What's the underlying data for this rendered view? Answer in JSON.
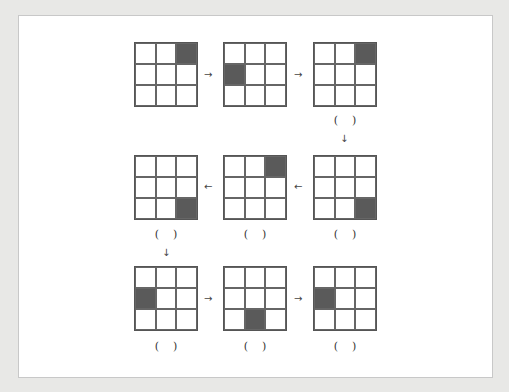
{
  "title": "",
  "colors": {
    "filled": "#5a5a5a",
    "empty": "#ffffff",
    "line": "#555555",
    "background": "#e8e8e6"
  },
  "grids": [
    {
      "id": 1,
      "filled": [
        0,
        2
      ],
      "label": ""
    },
    {
      "id": 2,
      "filled": [
        1,
        0
      ],
      "label": ""
    },
    {
      "id": 3,
      "filled": [
        0,
        2
      ],
      "label": "(    )"
    },
    {
      "id": 4,
      "filled": [
        2,
        2
      ],
      "label": "(    )"
    },
    {
      "id": 5,
      "filled": [
        0,
        2
      ],
      "label": "(    )"
    },
    {
      "id": 6,
      "filled": [
        2,
        2
      ],
      "label": "(    )"
    },
    {
      "id": 7,
      "filled": [
        1,
        0
      ],
      "label": "(    )"
    },
    {
      "id": 8,
      "filled": [
        2,
        1
      ],
      "label": "(    )"
    },
    {
      "id": 9,
      "filled": [
        1,
        0
      ],
      "label": "(    )"
    }
  ],
  "arrows": {
    "right": "→",
    "left": "←",
    "down": "↓"
  }
}
